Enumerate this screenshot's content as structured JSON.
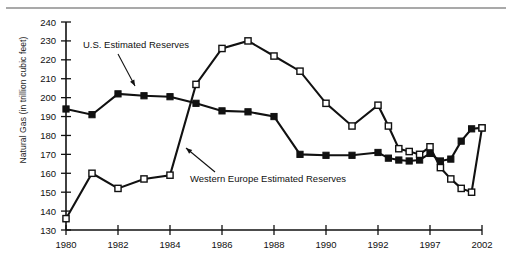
{
  "chart_data": {
    "type": "line",
    "title": "",
    "xlabel": "",
    "ylabel": "Natural Gas (in trillion cubic feet)",
    "ylim": [
      130,
      240
    ],
    "yticks": [
      130,
      140,
      150,
      160,
      170,
      180,
      190,
      200,
      210,
      220,
      230,
      240
    ],
    "grid": false,
    "legend_position": "inline-annotations",
    "categories": [
      "1980",
      "1981",
      "1982",
      "1983",
      "1984",
      "1985",
      "1986",
      "1987",
      "1988",
      "1989",
      "1990",
      "1991",
      "1992",
      "1993",
      "1994",
      "1995",
      "1996",
      "1997",
      "1998",
      "1999",
      "2000",
      "2001",
      "2002"
    ],
    "xticks": [
      "1980",
      "1982",
      "1984",
      "1986",
      "1988",
      "1990",
      "1992",
      "1997",
      "2002"
    ],
    "series": [
      {
        "name": "U.S. Estimated Reserves",
        "marker": "filled-square",
        "values": [
          194,
          191,
          202,
          201,
          200.5,
          197,
          193,
          192.5,
          190,
          170,
          169.5,
          169.5,
          171,
          168,
          167,
          166.5,
          167,
          170.5,
          166.5,
          167.5,
          177,
          183.5,
          184
        ]
      },
      {
        "name": "Western Europe Estimated Reserves",
        "marker": "open-square",
        "values": [
          136,
          160,
          152,
          157,
          159,
          207,
          226,
          230,
          222,
          214,
          197,
          185,
          196,
          185,
          173,
          171.5,
          170,
          174,
          163,
          157,
          152,
          150,
          184
        ]
      }
    ],
    "annotations": [
      {
        "name": "us-series-label",
        "text": "U.S. Estimated Reserves"
      },
      {
        "name": "western-europe-series-label",
        "text": "Western Europe Estimated Reserves"
      }
    ]
  },
  "axis": {
    "y_tick_labels": [
      "240",
      "230",
      "220",
      "210",
      "200",
      "190",
      "180",
      "170",
      "160",
      "150",
      "140",
      "130"
    ],
    "x_tick_labels": [
      "1980",
      "1982",
      "1984",
      "1986",
      "1988",
      "1990",
      "1992",
      "1997",
      "2002"
    ],
    "y_axis_title": "Natural Gas (in trillion cubic feet)"
  },
  "colors": {
    "line": "#111111",
    "axis": "#111111",
    "background": "#ffffff",
    "top_rule": "#a9a9a9"
  }
}
